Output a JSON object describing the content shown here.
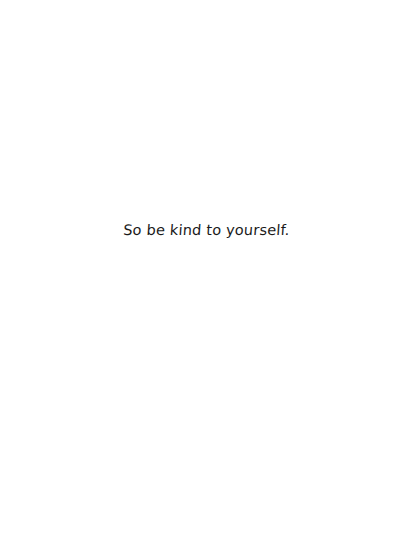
{
  "page": {
    "background": "#ffffff",
    "quote": "So be kind to yourself.",
    "text_color": "#1a1a1a"
  }
}
